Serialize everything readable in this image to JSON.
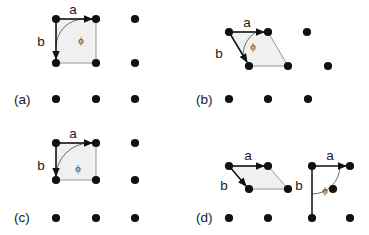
{
  "figure": {
    "width": 369,
    "height": 235,
    "background": "#ffffff",
    "dot_color": "#111111",
    "cell_fill_color": "#f0f0f0",
    "cell_edge_color": "#8a8a8a",
    "arrow_color": "#111111",
    "arc_color": "#6e6e6e"
  },
  "panels": [
    {
      "id": "a",
      "label": "(a)",
      "label_pos": {
        "x": 14,
        "y": 104
      },
      "lattice_type": "square",
      "vector_a": {
        "label": "a",
        "label_pos": {
          "x": 73,
          "y": 14
        },
        "from": {
          "x": 56,
          "y": 19
        },
        "to": {
          "x": 96,
          "y": 19
        }
      },
      "vector_b": {
        "label": "b",
        "label_pos": {
          "x": 41,
          "y": 46
        },
        "from": {
          "x": 56,
          "y": 19
        },
        "to": {
          "x": 56,
          "y": 63
        }
      },
      "angle": {
        "label": "ϕ",
        "label_pos": {
          "x": 81,
          "y": 44
        },
        "value_deg": 90
      },
      "cell_polygon": [
        {
          "x": 56,
          "y": 19
        },
        {
          "x": 96,
          "y": 19
        },
        {
          "x": 96,
          "y": 63
        },
        {
          "x": 56,
          "y": 63
        }
      ],
      "dots": [
        {
          "x": 56,
          "y": 19
        },
        {
          "x": 96,
          "y": 19
        },
        {
          "x": 135,
          "y": 19
        },
        {
          "x": 56,
          "y": 63
        },
        {
          "x": 96,
          "y": 63
        },
        {
          "x": 135,
          "y": 63
        },
        {
          "x": 56,
          "y": 99
        },
        {
          "x": 96,
          "y": 99
        },
        {
          "x": 135,
          "y": 99
        }
      ]
    },
    {
      "id": "b",
      "label": "(b)",
      "label_pos": {
        "x": 196,
        "y": 104
      },
      "lattice_type": "oblique",
      "vector_a": {
        "label": "a",
        "label_pos": {
          "x": 247,
          "y": 27
        },
        "from": {
          "x": 229,
          "y": 32
        },
        "to": {
          "x": 268,
          "y": 32
        }
      },
      "vector_b": {
        "label": "b",
        "label_pos": {
          "x": 219,
          "y": 58
        },
        "from": {
          "x": 229,
          "y": 32
        },
        "to": {
          "x": 249,
          "y": 66
        }
      },
      "angle": {
        "label": "ϕ",
        "label_pos": {
          "x": 253,
          "y": 50
        },
        "value_deg": 60
      },
      "cell_polygon": [
        {
          "x": 229,
          "y": 32
        },
        {
          "x": 268,
          "y": 32
        },
        {
          "x": 288,
          "y": 66
        },
        {
          "x": 249,
          "y": 66
        }
      ],
      "dots": [
        {
          "x": 229,
          "y": 32
        },
        {
          "x": 268,
          "y": 32
        },
        {
          "x": 307,
          "y": 32
        },
        {
          "x": 249,
          "y": 66
        },
        {
          "x": 288,
          "y": 66
        },
        {
          "x": 328,
          "y": 66
        },
        {
          "x": 229,
          "y": 99
        },
        {
          "x": 268,
          "y": 99
        },
        {
          "x": 308,
          "y": 99
        }
      ]
    },
    {
      "id": "c",
      "label": "(c)",
      "label_pos": {
        "x": 14,
        "y": 222
      },
      "lattice_type": "rectangular",
      "vector_a": {
        "label": "a",
        "label_pos": {
          "x": 73,
          "y": 138
        },
        "from": {
          "x": 56,
          "y": 143
        },
        "to": {
          "x": 96,
          "y": 143
        }
      },
      "vector_b": {
        "label": "b",
        "label_pos": {
          "x": 41,
          "y": 170
        },
        "from": {
          "x": 56,
          "y": 143
        },
        "to": {
          "x": 56,
          "y": 180
        }
      },
      "angle": {
        "label": "ϕ",
        "label_pos": {
          "x": 78,
          "y": 172
        },
        "value_deg": 90
      },
      "cell_polygon": [
        {
          "x": 56,
          "y": 143
        },
        {
          "x": 96,
          "y": 143
        },
        {
          "x": 96,
          "y": 180
        },
        {
          "x": 56,
          "y": 180
        }
      ],
      "dots": [
        {
          "x": 56,
          "y": 143
        },
        {
          "x": 96,
          "y": 143
        },
        {
          "x": 135,
          "y": 143
        },
        {
          "x": 56,
          "y": 180
        },
        {
          "x": 96,
          "y": 180
        },
        {
          "x": 135,
          "y": 180
        },
        {
          "x": 56,
          "y": 218
        },
        {
          "x": 96,
          "y": 218
        },
        {
          "x": 135,
          "y": 218
        }
      ]
    },
    {
      "id": "d",
      "label": "(d)",
      "label_pos": {
        "x": 196,
        "y": 222
      },
      "lattice_type": "centered-rectangular",
      "vector_a": {
        "label": "a",
        "label_pos": {
          "x": 248,
          "y": 160
        },
        "from": {
          "x": 229,
          "y": 166
        },
        "to": {
          "x": 268,
          "y": 166
        }
      },
      "vector_b": {
        "label": "b",
        "label_pos": {
          "x": 224,
          "y": 190
        },
        "from": {
          "x": 229,
          "y": 166
        },
        "to": {
          "x": 249,
          "y": 189
        }
      },
      "cell_polygon": [
        {
          "x": 229,
          "y": 166
        },
        {
          "x": 268,
          "y": 166
        },
        {
          "x": 288,
          "y": 189
        },
        {
          "x": 249,
          "y": 189
        }
      ],
      "vector_a2": {
        "label": "a",
        "label_pos": {
          "x": 330,
          "y": 160
        },
        "from": {
          "x": 312,
          "y": 166
        },
        "to": {
          "x": 350,
          "y": 166
        }
      },
      "vector_b2": {
        "label": "b",
        "label_pos": {
          "x": 299,
          "y": 190
        },
        "from": {
          "x": 312,
          "y": 166
        },
        "to": {
          "x": 312,
          "y": 218
        }
      },
      "angle": {
        "label": "ϕ",
        "label_pos": {
          "x": 325,
          "y": 194
        },
        "value_deg": 90
      },
      "dots": [
        {
          "x": 229,
          "y": 166
        },
        {
          "x": 268,
          "y": 166
        },
        {
          "x": 312,
          "y": 166
        },
        {
          "x": 350,
          "y": 166
        },
        {
          "x": 249,
          "y": 189
        },
        {
          "x": 288,
          "y": 189
        },
        {
          "x": 333,
          "y": 189
        },
        {
          "x": 229,
          "y": 218
        },
        {
          "x": 268,
          "y": 218
        },
        {
          "x": 312,
          "y": 218
        },
        {
          "x": 350,
          "y": 218
        }
      ]
    }
  ]
}
